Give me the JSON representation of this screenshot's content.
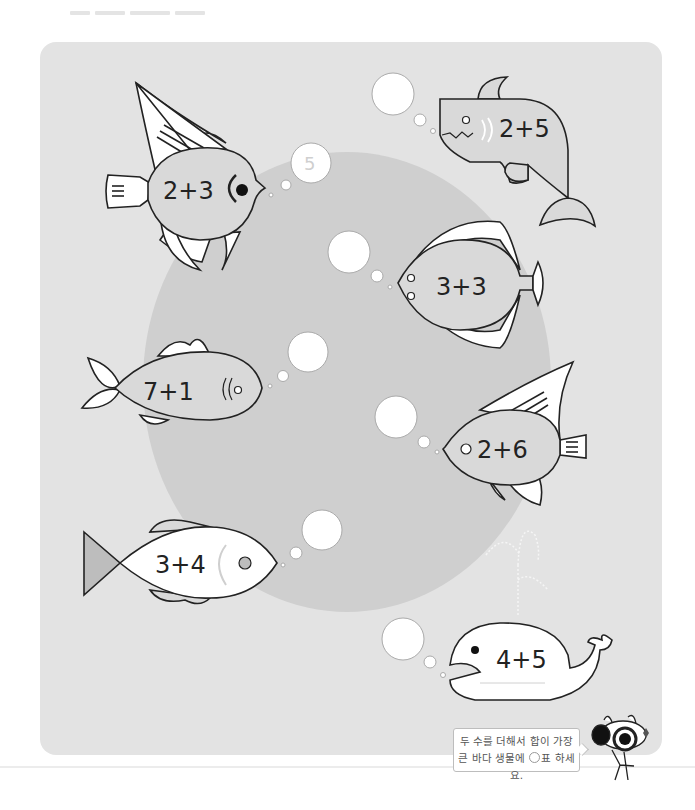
{
  "worksheet": {
    "instruction_lines": [
      "두 수를 더해서 합이 가장",
      "큰 바다 생물에 ",
      "표 하세요."
    ],
    "instruction_mark_icon": "circle-mark-icon",
    "example_answer": "5"
  },
  "creatures": [
    {
      "id": "angelfish-1",
      "kind": "angelfish",
      "equation": "2+3",
      "answer_shown": "5"
    },
    {
      "id": "shark",
      "kind": "shark",
      "equation": "2+5",
      "answer_shown": ""
    },
    {
      "id": "flounder",
      "kind": "flounder",
      "equation": "3+3",
      "answer_shown": ""
    },
    {
      "id": "long-fish",
      "kind": "fish",
      "equation": "7+1",
      "answer_shown": ""
    },
    {
      "id": "angelfish-2",
      "kind": "angelfish",
      "equation": "2+6",
      "answer_shown": ""
    },
    {
      "id": "white-fish",
      "kind": "fish",
      "equation": "3+4",
      "answer_shown": ""
    },
    {
      "id": "whale",
      "kind": "whale",
      "equation": "4+5",
      "answer_shown": ""
    }
  ],
  "colors": {
    "panel": "#e3e3e3",
    "big_circle": "#cfcfcf",
    "outline": "#222222",
    "fill_white": "#ffffff",
    "fish_gray": "#d9d9d9"
  }
}
